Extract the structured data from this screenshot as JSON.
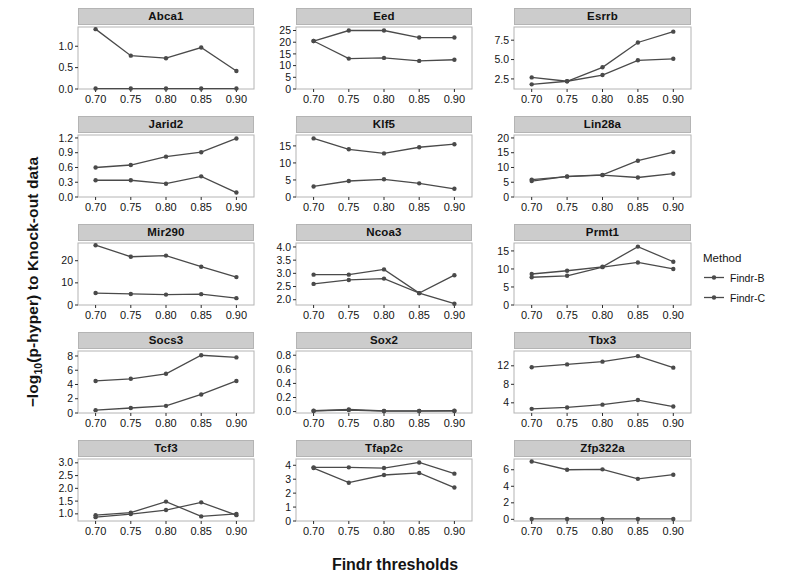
{
  "chart_data": {
    "type": "line",
    "title": "",
    "xlabel": "Findr thresholds",
    "ylabel_html": "−log<sub>10</sub>(p-hyper) to Knock-out data",
    "ylabel": "−log10(p-hyper) to Knock-out data",
    "x": [
      0.7,
      0.75,
      0.8,
      0.85,
      0.9
    ],
    "xtick_labels": [
      "0.70",
      "0.75",
      "0.80",
      "0.85",
      "0.90"
    ],
    "legend": {
      "title": "Method",
      "position": "right",
      "entries": [
        {
          "name": "Findr-B",
          "color": "#4a4a4a"
        },
        {
          "name": "Findr-C",
          "color": "#4a4a4a"
        }
      ]
    },
    "series_names": [
      "Findr-B",
      "Findr-C"
    ],
    "grid": false,
    "layout": {
      "rows": 5,
      "cols": 3
    },
    "panels": [
      {
        "name": "Abca1",
        "ylim": [
          0.0,
          1.45
        ],
        "yticks": [
          0.0,
          0.5,
          1.0
        ],
        "ytick_labels": [
          "0.0",
          "0.5",
          "1.0"
        ],
        "series": [
          {
            "name": "Findr-B",
            "values": [
              1.4,
              0.78,
              0.72,
              0.97,
              0.42
            ]
          },
          {
            "name": "Findr-C",
            "values": [
              0.01,
              0.01,
              0.01,
              0.01,
              0.01
            ]
          }
        ]
      },
      {
        "name": "Eed",
        "ylim": [
          0,
          26.5
        ],
        "yticks": [
          0,
          5,
          10,
          15,
          20,
          25
        ],
        "ytick_labels": [
          "0",
          "5",
          "10",
          "15",
          "20",
          "25"
        ],
        "series": [
          {
            "name": "Findr-B",
            "values": [
              20.5,
              25.0,
              25.0,
              22.0,
              22.0
            ]
          },
          {
            "name": "Findr-C",
            "values": [
              20.5,
              13.0,
              13.3,
              12.0,
              12.5
            ]
          }
        ]
      },
      {
        "name": "Esrrb",
        "ylim": [
          1.2,
          9.2
        ],
        "yticks": [
          2.5,
          5.0,
          7.5
        ],
        "ytick_labels": [
          "2.5",
          "5.0",
          "7.5"
        ],
        "series": [
          {
            "name": "Findr-B",
            "values": [
              1.8,
              2.2,
              4.0,
              7.2,
              8.6
            ]
          },
          {
            "name": "Findr-C",
            "values": [
              2.7,
              2.2,
              3.0,
              4.9,
              5.1
            ]
          }
        ]
      },
      {
        "name": "Jarid2",
        "ylim": [
          0.0,
          1.26
        ],
        "yticks": [
          0.0,
          0.3,
          0.6,
          0.9,
          1.2
        ],
        "ytick_labels": [
          "0.0",
          "0.3",
          "0.6",
          "0.9",
          "1.2"
        ],
        "series": [
          {
            "name": "Findr-B",
            "values": [
              0.6,
              0.65,
              0.82,
              0.91,
              1.19
            ]
          },
          {
            "name": "Findr-C",
            "values": [
              0.34,
              0.34,
              0.27,
              0.42,
              0.09
            ]
          }
        ]
      },
      {
        "name": "Klf5",
        "ylim": [
          0,
          18.2
        ],
        "yticks": [
          0,
          5,
          10,
          15
        ],
        "ytick_labels": [
          "0",
          "5",
          "10",
          "15"
        ],
        "series": [
          {
            "name": "Findr-B",
            "values": [
              17.2,
              14.0,
              12.8,
              14.6,
              15.5
            ]
          },
          {
            "name": "Findr-C",
            "values": [
              3.1,
              4.7,
              5.2,
              4.0,
              2.4
            ]
          }
        ]
      },
      {
        "name": "Lin28a",
        "ylim": [
          0,
          21
        ],
        "yticks": [
          0,
          5,
          10,
          15,
          20
        ],
        "ytick_labels": [
          "0",
          "5",
          "10",
          "15",
          "20"
        ],
        "series": [
          {
            "name": "Findr-B",
            "values": [
              5.4,
              7.0,
              7.5,
              12.3,
              15.2
            ]
          },
          {
            "name": "Findr-C",
            "values": [
              5.9,
              6.9,
              7.4,
              6.6,
              7.9
            ]
          }
        ]
      },
      {
        "name": "Mir290",
        "ylim": [
          0,
          28
        ],
        "yticks": [
          0,
          10,
          20
        ],
        "ytick_labels": [
          "0",
          "10",
          "20"
        ],
        "series": [
          {
            "name": "Findr-B",
            "values": [
              27.0,
              21.8,
              22.3,
              17.3,
              12.6
            ]
          },
          {
            "name": "Findr-C",
            "values": [
              5.4,
              5.0,
              4.7,
              4.9,
              3.1
            ]
          }
        ]
      },
      {
        "name": "Ncoa3",
        "ylim": [
          1.8,
          4.15
        ],
        "yticks": [
          2.0,
          2.5,
          3.0,
          3.5,
          4.0
        ],
        "ytick_labels": [
          "2.0",
          "2.5",
          "3.0",
          "3.5",
          "4.0"
        ],
        "series": [
          {
            "name": "Findr-B",
            "values": [
              2.95,
              2.95,
              3.15,
              2.25,
              1.85
            ]
          },
          {
            "name": "Findr-C",
            "values": [
              2.6,
              2.75,
              2.8,
              2.25,
              2.93
            ]
          }
        ]
      },
      {
        "name": "Prmt1",
        "ylim": [
          0,
          17.2
        ],
        "yticks": [
          0,
          5,
          10,
          15
        ],
        "ytick_labels": [
          "0",
          "5",
          "10",
          "15"
        ],
        "series": [
          {
            "name": "Findr-B",
            "values": [
              8.6,
              9.5,
              10.6,
              16.2,
              12.0
            ]
          },
          {
            "name": "Findr-C",
            "values": [
              7.7,
              8.1,
              10.5,
              11.8,
              10.0
            ]
          }
        ]
      },
      {
        "name": "Socs3",
        "ylim": [
          0,
          8.7
        ],
        "yticks": [
          0,
          2,
          4,
          6,
          8
        ],
        "ytick_labels": [
          "0",
          "2",
          "4",
          "6",
          "8"
        ],
        "series": [
          {
            "name": "Findr-B",
            "values": [
              4.5,
              4.8,
              5.5,
              8.1,
              7.8
            ]
          },
          {
            "name": "Findr-C",
            "values": [
              0.4,
              0.7,
              1.0,
              2.6,
              4.5
            ]
          }
        ]
      },
      {
        "name": "Sox2",
        "ylim": [
          -0.02,
          0.86
        ],
        "yticks": [
          0.0,
          0.2,
          0.4,
          0.6,
          0.8
        ],
        "ytick_labels": [
          "0.0",
          "0.2",
          "0.4",
          "0.6",
          "0.8"
        ],
        "series": [
          {
            "name": "Findr-B",
            "values": [
              0.012,
              0.03,
              0.01,
              0.01,
              0.012
            ]
          },
          {
            "name": "Findr-C",
            "values": [
              0.01,
              0.022,
              0.008,
              0.008,
              0.01
            ]
          }
        ]
      },
      {
        "name": "Tbx3",
        "ylim": [
          1.8,
          15.2
        ],
        "yticks": [
          4,
          8,
          12
        ],
        "ytick_labels": [
          "4",
          "8",
          "12"
        ],
        "series": [
          {
            "name": "Findr-B",
            "values": [
              11.7,
              12.3,
              12.9,
              14.1,
              11.6
            ]
          },
          {
            "name": "Findr-C",
            "values": [
              2.7,
              3.0,
              3.6,
              4.6,
              3.2
            ]
          }
        ]
      },
      {
        "name": "Tcf3",
        "ylim": [
          0.72,
          3.15
        ],
        "yticks": [
          1.0,
          1.5,
          2.0,
          2.5,
          3.0
        ],
        "ytick_labels": [
          "1.0",
          "1.5",
          "2.0",
          "2.5",
          "3.0"
        ],
        "series": [
          {
            "name": "Findr-B",
            "values": [
              0.95,
              1.05,
              1.48,
              0.9,
              1.0
            ]
          },
          {
            "name": "Findr-C",
            "values": [
              0.87,
              0.99,
              1.15,
              1.45,
              0.95
            ]
          }
        ]
      },
      {
        "name": "Tfap2c",
        "ylim": [
          0,
          4.45
        ],
        "yticks": [
          0,
          1,
          2,
          3,
          4
        ],
        "ytick_labels": [
          "0",
          "1",
          "2",
          "3",
          "4"
        ],
        "series": [
          {
            "name": "Findr-B",
            "values": [
              3.85,
              3.85,
              3.8,
              4.2,
              3.4
            ]
          },
          {
            "name": "Findr-C",
            "values": [
              3.8,
              2.75,
              3.3,
              3.45,
              2.4
            ]
          }
        ]
      },
      {
        "name": "Zfp322a",
        "ylim": [
          -0.2,
          7.3
        ],
        "yticks": [
          0,
          2,
          4,
          6
        ],
        "ytick_labels": [
          "0",
          "2",
          "4",
          "6"
        ],
        "series": [
          {
            "name": "Findr-B",
            "values": [
              7.0,
              6.0,
              6.05,
              4.9,
              5.4
            ]
          },
          {
            "name": "Findr-C",
            "values": [
              0.05,
              0.05,
              0.05,
              0.05,
              0.05
            ]
          }
        ]
      }
    ]
  },
  "style": {
    "line_color": "#4a4a4a",
    "strip_bg": "#cccccc",
    "axis_color": "#2b2b2b",
    "text_color": "#141414"
  }
}
